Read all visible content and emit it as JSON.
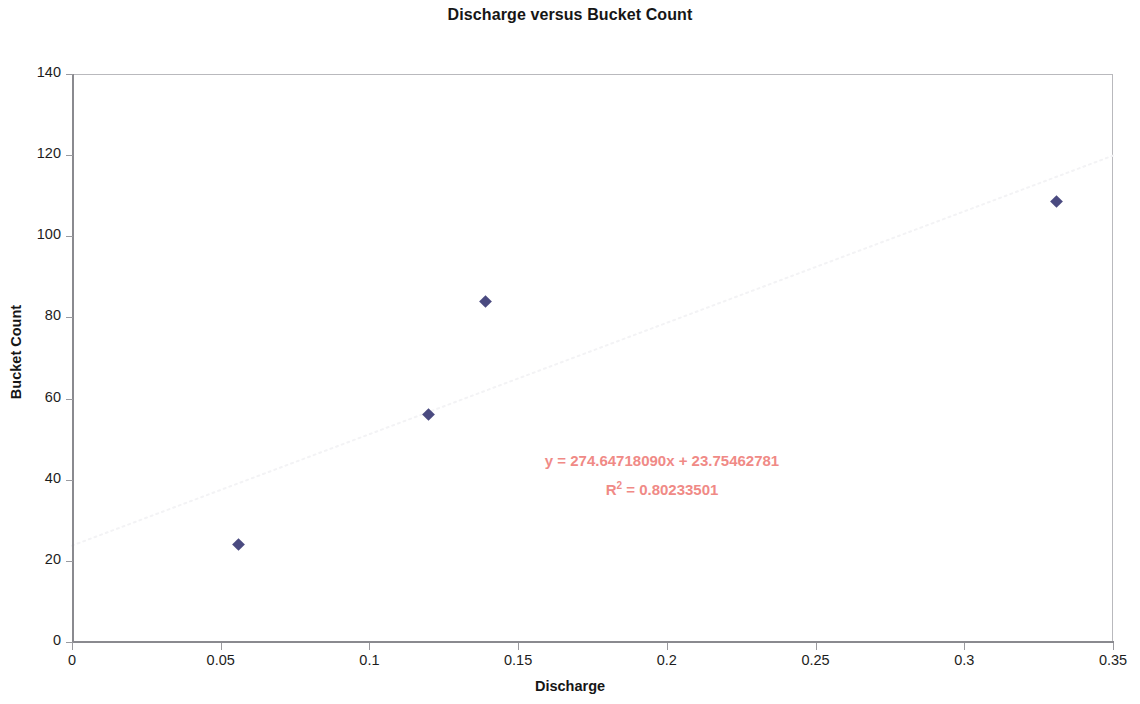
{
  "chart_data": {
    "type": "scatter",
    "title": "Discharge versus Bucket Count",
    "xlabel": "Discharge",
    "ylabel": "Bucket Count",
    "xlim": [
      0,
      0.35
    ],
    "ylim": [
      0,
      140
    ],
    "x_ticks": [
      "0",
      "0.05",
      "0.1",
      "0.15",
      "0.2",
      "0.25",
      "0.3",
      "0.35"
    ],
    "x_tick_values": [
      0,
      0.05,
      0.1,
      0.15,
      0.2,
      0.25,
      0.3,
      0.35
    ],
    "y_ticks": [
      "0",
      "20",
      "40",
      "60",
      "80",
      "100",
      "120",
      "140"
    ],
    "y_tick_values": [
      0,
      20,
      40,
      60,
      80,
      100,
      120,
      140
    ],
    "grid": false,
    "legend": false,
    "series": [
      {
        "name": "Bucket Count",
        "marker": "diamond",
        "color": "#4a4a80",
        "points": [
          {
            "x": 0.056,
            "y": 24.0
          },
          {
            "x": 0.12,
            "y": 56.0
          },
          {
            "x": 0.139,
            "y": 84.0
          },
          {
            "x": 0.331,
            "y": 108.5
          }
        ]
      }
    ],
    "trendline": {
      "type": "linear",
      "slope": 274.6471809,
      "intercept": 23.75462781,
      "r_squared": 0.80233501,
      "color": "#f3f3f5",
      "style": "dotted"
    },
    "annotations": {
      "equation": "y = 274.64718090x + 23.75462781",
      "r_squared_prefix": "R",
      "r_squared_exponent": "2",
      "r_squared_value": " = 0.80233501",
      "color": "#f08a86"
    }
  },
  "colors": {
    "marker": "#4a4a80",
    "annotation": "#f08a86",
    "axis": "#8a8a8f",
    "frame": "#b9b9bd",
    "text": "#161616",
    "background": "#ffffff"
  }
}
